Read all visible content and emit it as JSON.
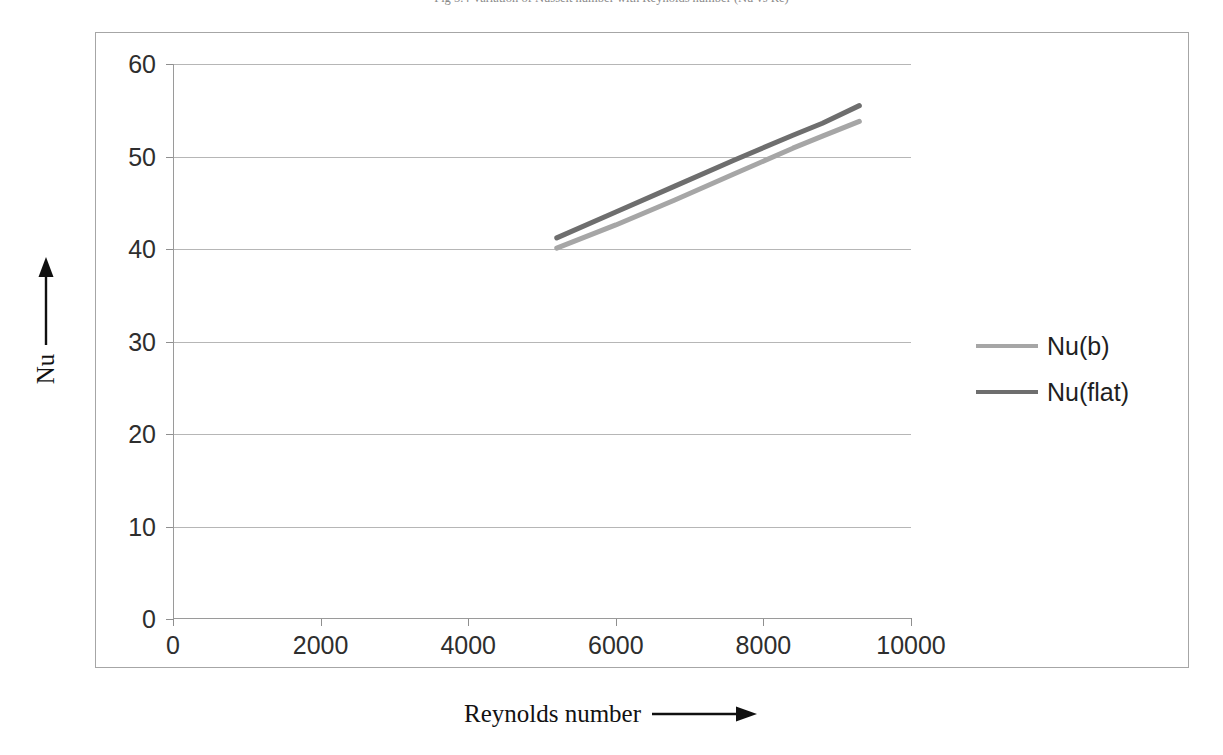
{
  "caption": {
    "text": "Fig 5.4  Variation of Nusselt number with Reynolds number (Nu vs Re)"
  },
  "chart_data": {
    "type": "line",
    "title": "",
    "xlabel": "Reynolds number",
    "ylabel": "Nu",
    "xlim": [
      0,
      10000
    ],
    "ylim": [
      0,
      60
    ],
    "xticks": [
      0,
      2000,
      4000,
      6000,
      8000,
      10000
    ],
    "yticks": [
      0,
      10,
      20,
      30,
      40,
      50,
      60
    ],
    "xtick_labels": [
      "0",
      "2000",
      "4000",
      "6000",
      "8000",
      "10000"
    ],
    "ytick_labels": [
      "0",
      "10",
      "20",
      "30",
      "40",
      "50",
      "60"
    ],
    "grid": "horizontal",
    "legend_position": "right",
    "series": [
      {
        "name": "Nu(b)",
        "color": "#a6a6a6",
        "x": [
          5200,
          6000,
          6800,
          7600,
          8400,
          8800,
          9300
        ],
        "values": [
          40.1,
          42.6,
          45.3,
          48.1,
          50.9,
          52.2,
          53.8
        ]
      },
      {
        "name": "Nu(flat)",
        "color": "#6e6e6e",
        "x": [
          5200,
          6000,
          6800,
          7600,
          8400,
          8800,
          9300
        ],
        "values": [
          41.2,
          44.0,
          46.8,
          49.6,
          52.3,
          53.6,
          55.5
        ]
      }
    ]
  },
  "axis_titles": {
    "y": "Nu",
    "x": "Reynolds number",
    "y_arrow": "up-arrow",
    "x_arrow": "right-arrow"
  },
  "colors": {
    "frame": "#a6a6a6",
    "gridline": "#b6b6b6",
    "axis": "#9a9a9a",
    "tick_text": "#2e2e2e",
    "series_light": "#a6a6a6",
    "series_dark": "#6e6e6e",
    "background": "#ffffff"
  }
}
